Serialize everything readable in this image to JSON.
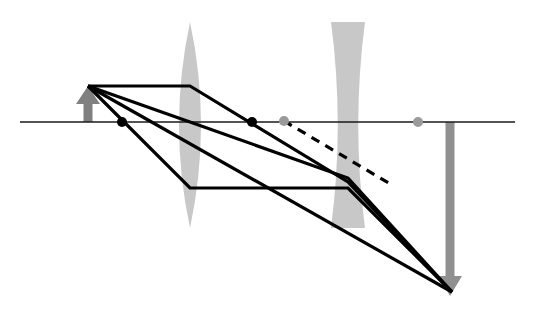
{
  "figure": {
    "type": "optics-ray-diagram",
    "width": 533,
    "height": 316,
    "background_color": "#ffffff"
  },
  "colors": {
    "axis": "#1a1a1a",
    "ray": "#000000",
    "virtual_ray_dashed": "#000000",
    "lens_glass": "#c8c8c8",
    "object_arrow": "#808080",
    "image_arrow": "#909090",
    "focal_point_real": "#000000",
    "focal_point_virtual": "#9a9a9a"
  },
  "optical_axis": {
    "label": "optical-axis",
    "y": 122,
    "x_start": 20,
    "x_end": 515,
    "stroke_width": 1.6
  },
  "elements": {
    "object_arrow": {
      "label": "object",
      "direction": "up",
      "x": 88,
      "base_y": 122,
      "tip_y": 86,
      "shaft_width": 9,
      "head_width": 24,
      "head_height": 18,
      "color": "#808080"
    },
    "converging_lens": {
      "label": "converging-lens",
      "kind": "biconvex",
      "center_x": 190,
      "top_y": 22,
      "bottom_y": 228,
      "max_half_width": 11,
      "color": "#c8c8c8"
    },
    "diverging_lens": {
      "label": "diverging-lens",
      "kind": "biconcave",
      "center_x": 348,
      "top_y": 22,
      "bottom_y": 228,
      "edge_half_width": 17,
      "waist_half_width": 3.5,
      "color": "#c8c8c8"
    },
    "image_arrow": {
      "label": "image",
      "direction": "down",
      "x": 450,
      "base_y": 122,
      "tip_y": 296,
      "shaft_width": 9,
      "head_width": 24,
      "head_height": 20,
      "color": "#909090"
    }
  },
  "markers": [
    {
      "name": "focal-point-left-converging",
      "x": 122,
      "y": 122,
      "r": 5.0,
      "color": "#000000",
      "kind": "real"
    },
    {
      "name": "focal-point-right-converging",
      "x": 252,
      "y": 122,
      "r": 5.0,
      "color": "#000000",
      "kind": "real"
    },
    {
      "name": "focal-point-left-diverging",
      "x": 284,
      "y": 121,
      "r": 5.0,
      "color": "#9a9a9a",
      "kind": "virtual"
    },
    {
      "name": "focal-point-right-diverging",
      "x": 418,
      "y": 122,
      "r": 5.0,
      "color": "#9a9a9a",
      "kind": "virtual"
    }
  ],
  "rays": [
    {
      "name": "ray-parallel-then-through-focus",
      "style": "solid",
      "stroke_width": 3.2,
      "points": [
        [
          88,
          86
        ],
        [
          190,
          86
        ],
        [
          348,
          182
        ],
        [
          452,
          292
        ]
      ]
    },
    {
      "name": "ray-through-lens-center",
      "style": "solid",
      "stroke_width": 3.2,
      "points": [
        [
          88,
          86
        ],
        [
          190,
          122
        ],
        [
          348,
          178
        ],
        [
          452,
          292
        ]
      ]
    },
    {
      "name": "ray-through-front-focus-then-parallel",
      "style": "solid",
      "stroke_width": 3.2,
      "points": [
        [
          88,
          86
        ],
        [
          190,
          188
        ],
        [
          348,
          188
        ],
        [
          452,
          292
        ]
      ]
    },
    {
      "name": "ray-long-chief-to-image",
      "style": "solid",
      "stroke_width": 3.2,
      "points": [
        [
          88,
          86
        ],
        [
          452,
          292
        ]
      ]
    },
    {
      "name": "ray-virtual-construction-dashed",
      "style": "dashed",
      "stroke_width": 3.2,
      "dash_pattern": "9 7",
      "points": [
        [
          284,
          121
        ],
        [
          392,
          185
        ]
      ]
    }
  ],
  "annotations": {
    "intermediate_image_note": "",
    "axis_note": ""
  }
}
